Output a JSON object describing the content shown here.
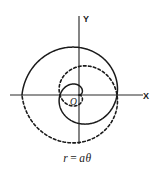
{
  "figure": {
    "name": "archimedean-spiral",
    "caption": {
      "lhs": "r",
      "operator": "=",
      "rhs": "aθ",
      "full": "r = aθ"
    },
    "axes": {
      "x_label": "X",
      "y_label": "Y",
      "origin_label": "O"
    },
    "colors": {
      "stroke": "#1a1a1a",
      "axis": "#2b2b2b",
      "background": "#ffffff"
    }
  },
  "chart_data": {
    "type": "line",
    "subtitle": "",
    "xlabel": "X",
    "ylabel": "Y",
    "grid": false,
    "legend_position": "none",
    "coordinate_system": "polar",
    "equation": "r = aθ",
    "parameter_a": 1,
    "xlim": [
      -3.5,
      3.5
    ],
    "ylim": [
      -3.5,
      3.5
    ],
    "annotations": [
      {
        "text": "O",
        "x": 0,
        "y": 0,
        "role": "origin"
      },
      {
        "text": "X",
        "x": 3.4,
        "y": 0,
        "role": "x-axis-label"
      },
      {
        "text": "Y",
        "x": 0,
        "y": 3.4,
        "role": "y-axis-label"
      }
    ],
    "series": [
      {
        "name": "positive branch",
        "style": "solid",
        "theta_range_rad": [
          0,
          9.4248
        ],
        "polar_points": [
          {
            "theta": 0.0,
            "r": 0.0
          },
          {
            "theta": 0.7854,
            "r": 0.7854
          },
          {
            "theta": 1.5708,
            "r": 1.5708
          },
          {
            "theta": 2.3562,
            "r": 2.3562
          },
          {
            "theta": 3.1416,
            "r": 3.1416
          },
          {
            "theta": 3.927,
            "r": 3.927
          },
          {
            "theta": 4.7124,
            "r": 4.7124
          },
          {
            "theta": 5.4978,
            "r": 5.4978
          },
          {
            "theta": 6.2832,
            "r": 6.2832
          },
          {
            "theta": 7.0686,
            "r": 7.0686
          },
          {
            "theta": 7.854,
            "r": 7.854
          },
          {
            "theta": 8.6394,
            "r": 8.6394
          },
          {
            "theta": 9.4248,
            "r": 9.4248
          }
        ]
      },
      {
        "name": "negative branch",
        "style": "dashed",
        "theta_range_rad": [
          0,
          -9.4248
        ],
        "polar_points": [
          {
            "theta": 0.0,
            "r": 0.0
          },
          {
            "theta": -0.7854,
            "r": 0.7854
          },
          {
            "theta": -1.5708,
            "r": 1.5708
          },
          {
            "theta": -2.3562,
            "r": 2.3562
          },
          {
            "theta": -3.1416,
            "r": 3.1416
          },
          {
            "theta": -3.927,
            "r": 3.927
          },
          {
            "theta": -4.7124,
            "r": 4.7124
          },
          {
            "theta": -5.4978,
            "r": 5.4978
          },
          {
            "theta": -6.2832,
            "r": 6.2832
          },
          {
            "theta": -7.0686,
            "r": 7.0686
          },
          {
            "theta": -7.854,
            "r": 7.854
          },
          {
            "theta": -8.6394,
            "r": 8.6394
          },
          {
            "theta": -9.4248,
            "r": 9.4248
          }
        ]
      }
    ]
  },
  "render": {
    "origin_px": {
      "x": 79,
      "y": 95
    },
    "scale_px_per_unit": 6.05,
    "axis_x_extent_px": {
      "x1": 10,
      "x2": 143
    },
    "axis_y_extent_px": {
      "y1": 16,
      "y2": 144
    }
  }
}
